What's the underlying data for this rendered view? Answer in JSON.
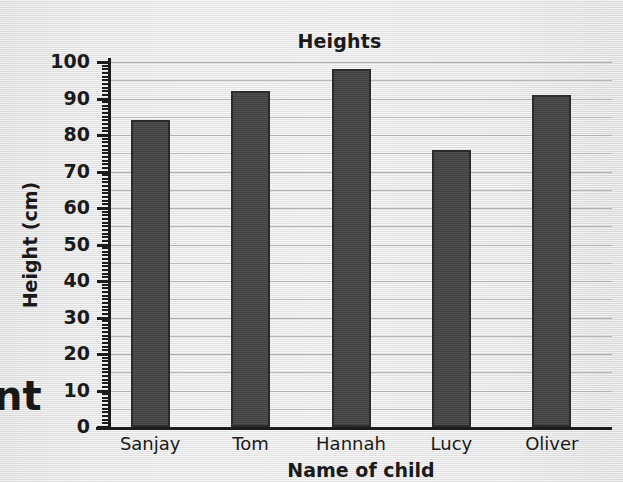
{
  "chart_data": {
    "type": "bar",
    "title": "Heights",
    "xlabel": "Name of child",
    "ylabel": "Height (cm)",
    "categories": [
      "Sanjay",
      "Tom",
      "Hannah",
      "Lucy",
      "Oliver"
    ],
    "values": [
      84,
      92,
      98,
      76,
      91
    ],
    "ylim": [
      0,
      100
    ],
    "y_major_tick_step": 10,
    "y_minor_tick_step": 1,
    "y_tick_labels": [
      "100",
      "90",
      "80",
      "70",
      "60",
      "50",
      "40",
      "30",
      "20",
      "10",
      "0"
    ],
    "gridlines": "horizontal every 5 units",
    "grid": true,
    "legend": "none",
    "bar_color": "#464646",
    "bar_border_color": "#2b2b2b",
    "background_color": "#eaeaea",
    "axis_color": "#1c1c1c",
    "gridline_color": "#b9b9b9"
  },
  "page": {
    "edge_text_fragment": "nt"
  }
}
